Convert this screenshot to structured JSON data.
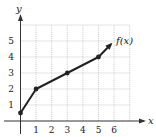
{
  "chart_data": {
    "type": "line",
    "title": "",
    "xlabel": "x",
    "ylabel": "y",
    "x_ticks": [
      "1",
      "2",
      "3",
      "4",
      "5",
      "6"
    ],
    "y_ticks": [
      "1",
      "2",
      "3",
      "4",
      "5"
    ],
    "xlim": [
      0,
      7
    ],
    "ylim": [
      0,
      6
    ],
    "grid": true,
    "series": [
      {
        "name": "f(x)",
        "points": [
          [
            0,
            0.5
          ],
          [
            1,
            2
          ],
          [
            3,
            3
          ],
          [
            5,
            4
          ]
        ],
        "arrow_to": [
          5.8,
          4.8
        ],
        "marked_points": [
          [
            0,
            0.5
          ],
          [
            1,
            2
          ],
          [
            3,
            3
          ],
          [
            5,
            4
          ]
        ]
      }
    ],
    "annotations": [
      {
        "text": "f(x)",
        "x": 6.1,
        "y": 4.8
      }
    ]
  },
  "labels": {
    "x_axis": "x",
    "y_axis": "y",
    "function": "f(x)"
  }
}
